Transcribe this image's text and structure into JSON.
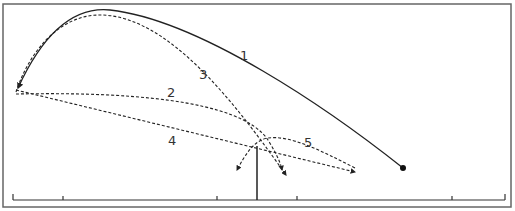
{
  "diagram": {
    "colors": {
      "background": "#ffffff",
      "frame": "#555555",
      "line": "#222222",
      "label": "#333333"
    },
    "labels": {
      "t1": "1",
      "t2": "2",
      "t3": "3",
      "t4": "4",
      "t5": "5"
    },
    "trajectories": [
      {
        "id": "1",
        "style": "solid",
        "from": "ball at right",
        "to": "left end"
      },
      {
        "id": "2",
        "style": "dashed",
        "from": "left end",
        "to": "right of net"
      },
      {
        "id": "3",
        "style": "dashed",
        "from": "left end (high arc)",
        "to": "right of net"
      },
      {
        "id": "4",
        "style": "dashed",
        "from": "left end",
        "to": "right court"
      },
      {
        "id": "5",
        "style": "dashed",
        "from": "near net",
        "to": "left of net"
      }
    ],
    "net": {
      "x": 257,
      "top": 146,
      "bottom": 200
    },
    "baseline": {
      "y": 200,
      "x_start": 13,
      "x_end": 505,
      "ticks": [
        63,
        217,
        297,
        452
      ]
    },
    "ball": {
      "x": 403,
      "y": 168
    }
  }
}
